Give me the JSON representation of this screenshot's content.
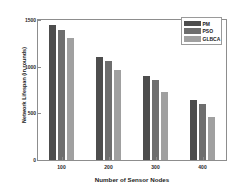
{
  "chart_data": {
    "type": "bar",
    "title": "",
    "xlabel": "Number of Sensor Nodes",
    "ylabel": "Network Lifespan (in rounds)",
    "categories": [
      "100",
      "200",
      "300",
      "400"
    ],
    "series": [
      {
        "name": "PM",
        "color": "#4d4d4d",
        "values": [
          1450,
          1105,
          900,
          640
        ]
      },
      {
        "name": "PSO",
        "color": "#6e6e6e",
        "values": [
          1390,
          1060,
          860,
          600
        ]
      },
      {
        "name": "GLBCA",
        "color": "#a0a0a0",
        "values": [
          1305,
          965,
          730,
          460
        ]
      }
    ],
    "ylim": [
      0,
      1500
    ],
    "yticks": [
      "0",
      "500",
      "1000",
      "1500"
    ],
    "ytick_values": [
      0,
      500,
      1000,
      1500
    ],
    "xticks": [
      "100",
      "200",
      "300",
      "400"
    ],
    "grid": false,
    "legend_position": "upper right"
  }
}
